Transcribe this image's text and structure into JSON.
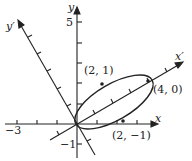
{
  "diagram": {
    "type": "rotated-axes-ellipse",
    "axes": {
      "x_label": "x",
      "y_label": "y",
      "x_prime_label": "x′",
      "y_prime_label": "y′",
      "tick_labels": {
        "x_neg": "−3",
        "y_pos": "5",
        "y_neg": "−1"
      }
    },
    "points": [
      {
        "label": "(2, 1)"
      },
      {
        "label": "(4, 0)"
      },
      {
        "label": "(2, −1)"
      }
    ]
  }
}
